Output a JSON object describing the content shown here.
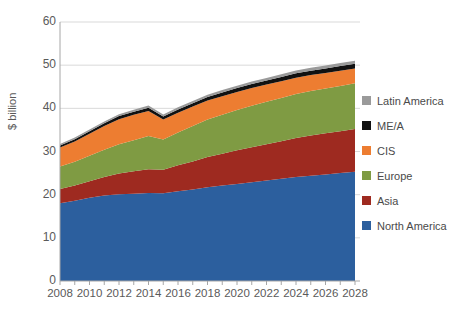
{
  "chart_data": {
    "type": "area",
    "title": "",
    "subtitle": "",
    "xlabel": "",
    "ylabel": "$ billion",
    "stacked": true,
    "grid": true,
    "legend_position": "right",
    "xlim": [
      2008,
      2028
    ],
    "ylim": [
      0,
      60
    ],
    "yticks": [
      0,
      10,
      20,
      30,
      40,
      50,
      60
    ],
    "x": [
      2008,
      2009,
      2010,
      2011,
      2012,
      2013,
      2014,
      2015,
      2016,
      2017,
      2018,
      2019,
      2020,
      2021,
      2022,
      2023,
      2024,
      2025,
      2026,
      2027,
      2028
    ],
    "xtick_labels": [
      "2008",
      "2010",
      "2012",
      "2014",
      "2016",
      "2018",
      "2020",
      "2022",
      "2024",
      "2026",
      "2028"
    ],
    "xticks": [
      2008,
      2010,
      2012,
      2014,
      2016,
      2018,
      2020,
      2022,
      2024,
      2026,
      2028
    ],
    "series": [
      {
        "name": "North America",
        "color": "#2C5F9E",
        "values": [
          18.0,
          18.6,
          19.3,
          19.8,
          20.1,
          20.2,
          20.4,
          20.3,
          20.8,
          21.2,
          21.7,
          22.1,
          22.5,
          22.9,
          23.3,
          23.7,
          24.1,
          24.4,
          24.7,
          25.0,
          25.3
        ]
      },
      {
        "name": "Asia",
        "color": "#9E2A20",
        "values": [
          3.3,
          3.5,
          3.8,
          4.3,
          4.8,
          5.2,
          5.5,
          5.5,
          6.0,
          6.5,
          7.0,
          7.4,
          7.8,
          8.1,
          8.4,
          8.7,
          9.0,
          9.3,
          9.5,
          9.7,
          9.9
        ]
      },
      {
        "name": "Europe",
        "color": "#7F9B43",
        "values": [
          5.2,
          5.5,
          5.9,
          6.3,
          6.8,
          7.2,
          7.7,
          7.0,
          7.6,
          8.2,
          8.7,
          9.0,
          9.3,
          9.6,
          9.8,
          10.0,
          10.2,
          10.3,
          10.4,
          10.5,
          10.6
        ]
      },
      {
        "name": "CIS",
        "color": "#ED7D31",
        "values": [
          4.4,
          4.7,
          5.1,
          5.5,
          5.8,
          5.9,
          5.8,
          4.6,
          4.6,
          4.5,
          4.4,
          4.3,
          4.2,
          4.1,
          4.0,
          3.9,
          3.8,
          3.7,
          3.6,
          3.5,
          3.4
        ]
      },
      {
        "name": "ME/A",
        "color": "#111111",
        "values": [
          0.5,
          0.55,
          0.6,
          0.65,
          0.7,
          0.72,
          0.75,
          0.7,
          0.75,
          0.8,
          0.85,
          0.88,
          0.9,
          0.92,
          0.95,
          0.97,
          1.0,
          1.02,
          1.05,
          1.08,
          1.1
        ]
      },
      {
        "name": "Latin America",
        "color": "#9A9A9A",
        "values": [
          0.35,
          0.38,
          0.4,
          0.42,
          0.45,
          0.46,
          0.48,
          0.45,
          0.48,
          0.5,
          0.52,
          0.54,
          0.56,
          0.58,
          0.6,
          0.62,
          0.64,
          0.66,
          0.68,
          0.7,
          0.72
        ]
      }
    ],
    "legend": [
      {
        "label": "Latin America",
        "color": "#9A9A9A"
      },
      {
        "label": "ME/A",
        "color": "#111111"
      },
      {
        "label": "CIS",
        "color": "#ED7D31"
      },
      {
        "label": "Europe",
        "color": "#7F9B43"
      },
      {
        "label": "Asia",
        "color": "#9E2A20"
      },
      {
        "label": "North America",
        "color": "#2C5F9E"
      }
    ]
  }
}
